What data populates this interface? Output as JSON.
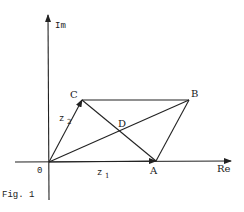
{
  "figure": {
    "caption": "Fig. 1",
    "axes": {
      "x_label": "Re",
      "y_label": "Im",
      "origin_label": "0"
    },
    "points": {
      "A": {
        "label": "A",
        "x": 156,
        "y": 161
      },
      "B": {
        "label": "B",
        "x": 189,
        "y": 100
      },
      "C": {
        "label": "C",
        "x": 82,
        "y": 100
      },
      "D": {
        "label": "D",
        "x": 119,
        "y": 131
      },
      "O": {
        "label": "0",
        "x": 49,
        "y": 162
      }
    },
    "vectors": {
      "z1": {
        "label": "z",
        "subscript": "1"
      },
      "z2": {
        "label": "z",
        "subscript": "2"
      }
    },
    "segments": [
      "OA",
      "OC",
      "CB",
      "AB",
      "OB",
      "CA"
    ]
  }
}
